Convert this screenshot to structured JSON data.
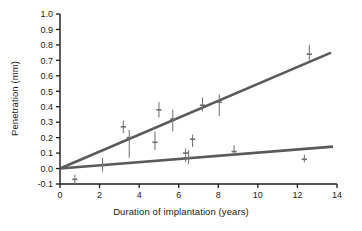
{
  "chart_data": {
    "type": "scatter",
    "title": "",
    "xlabel": "Duration of implantation (years)",
    "ylabel": "Penetration (mm)",
    "xlim": [
      0,
      14
    ],
    "ylim": [
      -0.1,
      1.0
    ],
    "xticks": [
      0,
      2,
      4,
      6,
      8,
      10,
      12,
      14
    ],
    "xtick_labels": [
      "0",
      "2",
      "4",
      "6",
      "8",
      "10",
      "12",
      "14"
    ],
    "yticks": [
      -0.1,
      0.0,
      0.1,
      0.2,
      0.3,
      0.4,
      0.5,
      0.6,
      0.7,
      0.8,
      0.9,
      1.0
    ],
    "ytick_labels": [
      "-0.1",
      "0.0",
      "0.1",
      "0.2",
      "0.3",
      "0.4",
      "0.5",
      "0.6",
      "0.7",
      "0.8",
      "0.9",
      "1.0"
    ],
    "grid": false,
    "legend": "none",
    "colors": {
      "line": "#5a5a5a",
      "marker": "#6e6e6e",
      "axis": "#1a1a1a",
      "text": "#1a1a1a",
      "background": "#ffffff"
    },
    "series": [
      {
        "name": "upper regression line",
        "type": "line",
        "x": [
          0,
          13.7
        ],
        "y": [
          0.0,
          0.75
        ],
        "slope": 0.0547,
        "intercept": 0.0
      },
      {
        "name": "lower regression line",
        "type": "line",
        "x": [
          0,
          13.8
        ],
        "y": [
          0.0,
          0.142
        ],
        "slope": 0.0103,
        "intercept": 0.0
      },
      {
        "name": "upper group data points",
        "type": "scatter_errorbar",
        "points": [
          {
            "x": 3.2,
            "y": 0.27,
            "yerr_low": 0.23,
            "yerr_high": 0.31
          },
          {
            "x": 3.5,
            "y": 0.2,
            "yerr_low": 0.07,
            "yerr_high": 0.25
          },
          {
            "x": 4.8,
            "y": 0.17,
            "yerr_low": 0.12,
            "yerr_high": 0.24
          },
          {
            "x": 5.0,
            "y": 0.38,
            "yerr_low": 0.33,
            "yerr_high": 0.43
          },
          {
            "x": 5.7,
            "y": 0.32,
            "yerr_low": 0.24,
            "yerr_high": 0.38
          },
          {
            "x": 7.2,
            "y": 0.41,
            "yerr_low": 0.37,
            "yerr_high": 0.46
          },
          {
            "x": 8.05,
            "y": 0.43,
            "yerr_low": 0.34,
            "yerr_high": 0.48
          },
          {
            "x": 12.6,
            "y": 0.74,
            "yerr_low": 0.7,
            "yerr_high": 0.8
          }
        ]
      },
      {
        "name": "lower group data points",
        "type": "scatter_errorbar",
        "points": [
          {
            "x": 0.75,
            "y": -0.07,
            "yerr_low": -0.1,
            "yerr_high": -0.04
          },
          {
            "x": 2.15,
            "y": 0.02,
            "yerr_low": -0.02,
            "yerr_high": 0.07
          },
          {
            "x": 6.35,
            "y": 0.1,
            "yerr_low": 0.04,
            "yerr_high": 0.13
          },
          {
            "x": 6.5,
            "y": 0.07,
            "yerr_low": 0.03,
            "yerr_high": 0.12
          },
          {
            "x": 6.7,
            "y": 0.19,
            "yerr_low": 0.14,
            "yerr_high": 0.22
          },
          {
            "x": 8.8,
            "y": 0.11,
            "yerr_low": 0.09,
            "yerr_high": 0.15
          },
          {
            "x": 12.35,
            "y": 0.06,
            "yerr_low": 0.04,
            "yerr_high": 0.09
          }
        ]
      }
    ]
  }
}
